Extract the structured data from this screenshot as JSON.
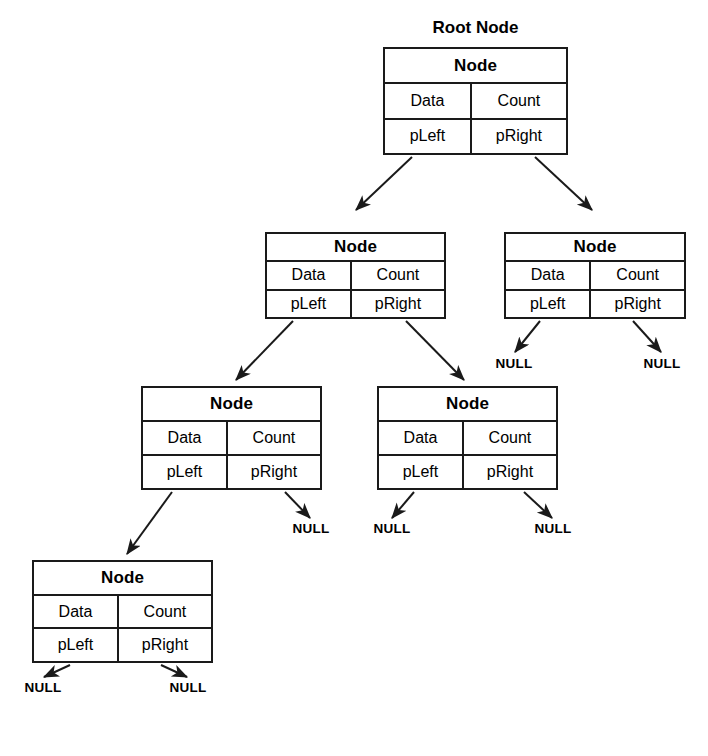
{
  "diagram": {
    "title": "Root Node",
    "node_header": "Node",
    "fields": {
      "data": "Data",
      "count": "Count",
      "p_left": "pLeft",
      "p_right": "pRight"
    },
    "null_label": "NULL",
    "colors": {
      "stroke": "#1a1a1a",
      "background": "#ffffff",
      "text": "#000000"
    },
    "nodes": [
      {
        "id": "root",
        "level": 0,
        "caption": "Root Node",
        "header": "Node",
        "data": "Data",
        "count": "Count",
        "p_left": "pLeft",
        "p_right": "pRight",
        "x": 383,
        "y": 47,
        "w": 185,
        "h": 108
      },
      {
        "id": "n-l",
        "level": 1,
        "caption": "",
        "header": "Node",
        "data": "Data",
        "count": "Count",
        "p_left": "pLeft",
        "p_right": "pRight",
        "x": 265,
        "y": 232,
        "w": 181,
        "h": 87
      },
      {
        "id": "n-r",
        "level": 1,
        "caption": "",
        "header": "Node",
        "data": "Data",
        "count": "Count",
        "p_left": "pLeft",
        "p_right": "pRight",
        "x": 504,
        "y": 232,
        "w": 182,
        "h": 87
      },
      {
        "id": "n-ll",
        "level": 2,
        "caption": "",
        "header": "Node",
        "data": "Data",
        "count": "Count",
        "p_left": "pLeft",
        "p_right": "pRight",
        "x": 141,
        "y": 386,
        "w": 181,
        "h": 104
      },
      {
        "id": "n-lr",
        "level": 2,
        "caption": "",
        "header": "Node",
        "data": "Data",
        "count": "Count",
        "p_left": "pLeft",
        "p_right": "pRight",
        "x": 377,
        "y": 386,
        "w": 181,
        "h": 104
      },
      {
        "id": "n-lll",
        "level": 3,
        "caption": "",
        "header": "Node",
        "data": "Data",
        "count": "Count",
        "p_left": "pLeft",
        "p_right": "pRight",
        "x": 32,
        "y": 560,
        "w": 181,
        "h": 103
      }
    ],
    "null_terminators": [
      {
        "id": "null-nr-left",
        "parent": "n-r",
        "from_field": "pLeft",
        "x": 514,
        "y": 366
      },
      {
        "id": "null-nr-right",
        "parent": "n-r",
        "from_field": "pRight",
        "x": 662,
        "y": 366
      },
      {
        "id": "null-nll-right",
        "parent": "n-ll",
        "from_field": "pRight",
        "x": 311,
        "y": 531
      },
      {
        "id": "null-nlr-left",
        "parent": "n-lr",
        "from_field": "pLeft",
        "x": 392,
        "y": 531
      },
      {
        "id": "null-nlr-right",
        "parent": "n-lr",
        "from_field": "pRight",
        "x": 553,
        "y": 531
      },
      {
        "id": "null-nlll-left",
        "parent": "n-lll",
        "from_field": "pLeft",
        "x": 43,
        "y": 690
      },
      {
        "id": "null-nlll-right",
        "parent": "n-lll",
        "from_field": "pRight",
        "x": 188,
        "y": 690
      }
    ],
    "edges": [
      {
        "id": "edge-root-left",
        "from": "root",
        "from_field": "pLeft",
        "to": "n-l",
        "x1": 412,
        "y1": 157,
        "x2": 356,
        "y2": 210
      },
      {
        "id": "edge-root-right",
        "from": "root",
        "from_field": "pRight",
        "to": "n-r",
        "x1": 535,
        "y1": 157,
        "x2": 592,
        "y2": 210
      },
      {
        "id": "edge-nl-left",
        "from": "n-l",
        "from_field": "pLeft",
        "to": "n-ll",
        "x1": 293,
        "y1": 321,
        "x2": 236,
        "y2": 380
      },
      {
        "id": "edge-nl-right",
        "from": "n-l",
        "from_field": "pRight",
        "to": "n-lr",
        "x1": 406,
        "y1": 321,
        "x2": 464,
        "y2": 380
      },
      {
        "id": "edge-nll-left",
        "from": "n-ll",
        "from_field": "pLeft",
        "to": "n-lll",
        "x1": 172,
        "y1": 492,
        "x2": 127,
        "y2": 554
      },
      {
        "id": "edge-nr-left",
        "from": "n-r",
        "from_field": "pLeft",
        "to": "null-nr-left",
        "x1": 540,
        "y1": 321,
        "x2": 515,
        "y2": 352
      },
      {
        "id": "edge-nr-right",
        "from": "n-r",
        "from_field": "pRight",
        "to": "null-nr-right",
        "x1": 633,
        "y1": 321,
        "x2": 661,
        "y2": 352
      },
      {
        "id": "edge-nll-right",
        "from": "n-ll",
        "from_field": "pRight",
        "to": "null-nll-right",
        "x1": 285,
        "y1": 492,
        "x2": 310,
        "y2": 518
      },
      {
        "id": "edge-nlr-left",
        "from": "n-lr",
        "from_field": "pLeft",
        "to": "null-nlr-left",
        "x1": 414,
        "y1": 492,
        "x2": 392,
        "y2": 518
      },
      {
        "id": "edge-nlr-right",
        "from": "n-lr",
        "from_field": "pRight",
        "to": "null-nlr-right",
        "x1": 524,
        "y1": 492,
        "x2": 552,
        "y2": 518
      },
      {
        "id": "edge-nlll-left",
        "from": "n-lll",
        "from_field": "pLeft",
        "to": "null-nlll-left",
        "x1": 70,
        "y1": 665,
        "x2": 44,
        "y2": 677
      },
      {
        "id": "edge-nlll-right",
        "from": "n-lll",
        "from_field": "pRight",
        "to": "null-nlll-right",
        "x1": 161,
        "y1": 665,
        "x2": 187,
        "y2": 677
      }
    ]
  }
}
